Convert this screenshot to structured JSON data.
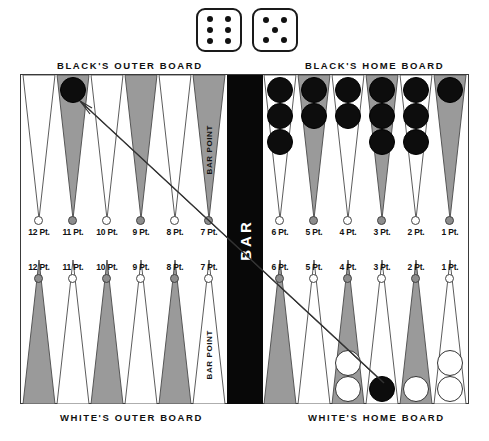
{
  "dice": {
    "name": "dice-roll",
    "values": [
      6,
      5
    ]
  },
  "board": {
    "captions": {
      "black_outer": "BLACK'S OUTER BOARD",
      "black_home": "BLACK'S HOME BOARD",
      "white_outer": "WHITE'S OUTER BOARD",
      "white_home": "WHITE'S HOME BOARD"
    },
    "bar_label": "BAR",
    "bar_point_label": "BAR POINT",
    "top_left_points": [
      {
        "label": "12 Pt.",
        "color": "white",
        "checkers": 0,
        "checker_color": "none"
      },
      {
        "label": "11 Pt.",
        "color": "grey",
        "checkers": 1,
        "checker_color": "black"
      },
      {
        "label": "10 Pt.",
        "color": "white",
        "checkers": 0,
        "checker_color": "none"
      },
      {
        "label": "9 Pt.",
        "color": "grey",
        "checkers": 0,
        "checker_color": "none"
      },
      {
        "label": "8 Pt.",
        "color": "white",
        "checkers": 0,
        "checker_color": "none"
      },
      {
        "label": "7 Pt.",
        "color": "grey",
        "checkers": 0,
        "checker_color": "none",
        "bar_point": true
      }
    ],
    "top_right_points": [
      {
        "label": "6 Pt.",
        "color": "white",
        "checkers": 3,
        "checker_color": "black"
      },
      {
        "label": "5 Pt.",
        "color": "grey",
        "checkers": 2,
        "checker_color": "black"
      },
      {
        "label": "4 Pt.",
        "color": "white",
        "checkers": 2,
        "checker_color": "black"
      },
      {
        "label": "3 Pt.",
        "color": "grey",
        "checkers": 3,
        "checker_color": "black"
      },
      {
        "label": "2 Pt.",
        "color": "white",
        "checkers": 3,
        "checker_color": "black"
      },
      {
        "label": "1 Pt.",
        "color": "grey",
        "checkers": 1,
        "checker_color": "black"
      }
    ],
    "bottom_left_points": [
      {
        "label": "12 Pt.",
        "color": "grey",
        "checkers": 0,
        "checker_color": "none"
      },
      {
        "label": "11 Pt.",
        "color": "white",
        "checkers": 0,
        "checker_color": "none"
      },
      {
        "label": "10 Pt.",
        "color": "grey",
        "checkers": 0,
        "checker_color": "none"
      },
      {
        "label": "9 Pt.",
        "color": "white",
        "checkers": 0,
        "checker_color": "none"
      },
      {
        "label": "8 Pt.",
        "color": "grey",
        "checkers": 0,
        "checker_color": "none"
      },
      {
        "label": "7 Pt.",
        "color": "white",
        "checkers": 0,
        "checker_color": "none",
        "bar_point": true
      }
    ],
    "bottom_right_points": [
      {
        "label": "6 Pt.",
        "color": "grey",
        "checkers": 0,
        "checker_color": "none"
      },
      {
        "label": "5 Pt.",
        "color": "white",
        "checkers": 0,
        "checker_color": "none"
      },
      {
        "label": "4 Pt.",
        "color": "grey",
        "checkers": 2,
        "checker_color": "white"
      },
      {
        "label": "3 Pt.",
        "color": "white",
        "checkers": 1,
        "checker_color": "black"
      },
      {
        "label": "2 Pt.",
        "color": "grey",
        "checkers": 1,
        "checker_color": "white"
      },
      {
        "label": "1 Pt.",
        "color": "white",
        "checkers": 2,
        "checker_color": "white"
      }
    ]
  },
  "colors": {
    "point_grey": "#9a9a9a",
    "point_white": "#ffffff",
    "checker_black": "#0d0d0d",
    "checker_white": "#ffffff",
    "bar_black": "#080808",
    "outline": "#3a3a3a"
  },
  "annotation": {
    "move_arrow": {
      "from": "black 11 Pt. (outer board)",
      "to": "white's 3 Pt. (home board)"
    }
  }
}
